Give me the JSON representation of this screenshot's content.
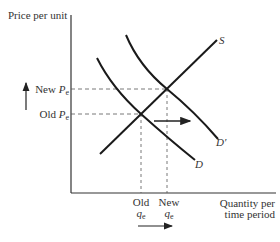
{
  "diagram": {
    "type": "supply-demand",
    "y_axis_label": "Price per unit",
    "x_axis_label_line1": "Quantity per",
    "x_axis_label_line2": "time period",
    "price_labels": {
      "new_prefix": "New ",
      "old_prefix": "Old ",
      "symbol": "P",
      "subscript": "e"
    },
    "quantity_labels": {
      "old_word": "Old",
      "new_word": "New",
      "symbol": "q",
      "subscript": "e"
    },
    "curves": [
      {
        "name": "supply",
        "label": "S"
      },
      {
        "name": "demand",
        "label": "D"
      },
      {
        "name": "demand-shifted",
        "label": "D′"
      }
    ],
    "annotations": [
      "Upward arrow beside price axis indicating price increase",
      "Rightward arrow between D and D′ indicating demand shift",
      "Rightward arrow below quantity axis indicating quantity increase"
    ]
  }
}
